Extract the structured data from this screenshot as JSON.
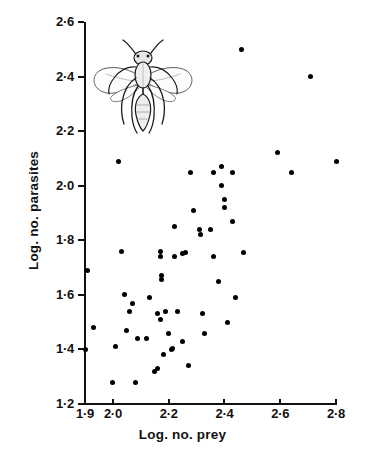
{
  "chart_data": {
    "type": "scatter",
    "title": "",
    "xlabel": "Log. no. prey",
    "ylabel": "Log. no. parasites",
    "xlim": [
      1.9,
      2.8
    ],
    "ylim": [
      1.2,
      2.6
    ],
    "grid": false,
    "legend": null,
    "xticks": [
      1.9,
      2.0,
      2.2,
      2.4,
      2.6,
      2.8
    ],
    "xtick_labels": [
      "1·9",
      "2·0",
      "2·2",
      "2·4",
      "2·6",
      "2·8"
    ],
    "yticks": [
      1.2,
      1.4,
      1.6,
      1.8,
      2.0,
      2.2,
      2.4,
      2.6
    ],
    "ytick_labels": [
      "1·2",
      "1·4",
      "1·6",
      "1·8",
      "2·0",
      "2·2",
      "2·4",
      "2·6"
    ],
    "marker": "filled-circle",
    "marker_color": "#000000",
    "points": [
      {
        "x": 1.9,
        "y": 1.4
      },
      {
        "x": 1.91,
        "y": 1.69
      },
      {
        "x": 1.93,
        "y": 1.48
      },
      {
        "x": 2.0,
        "y": 1.28
      },
      {
        "x": 2.01,
        "y": 1.41
      },
      {
        "x": 2.02,
        "y": 2.09
      },
      {
        "x": 2.03,
        "y": 1.76
      },
      {
        "x": 2.04,
        "y": 1.6
      },
      {
        "x": 2.05,
        "y": 1.47
      },
      {
        "x": 2.06,
        "y": 1.54
      },
      {
        "x": 2.07,
        "y": 1.57
      },
      {
        "x": 2.08,
        "y": 1.28
      },
      {
        "x": 2.09,
        "y": 1.44
      },
      {
        "x": 2.12,
        "y": 1.44
      },
      {
        "x": 2.13,
        "y": 1.59
      },
      {
        "x": 2.15,
        "y": 1.32
      },
      {
        "x": 2.16,
        "y": 1.33
      },
      {
        "x": 2.16,
        "y": 1.53
      },
      {
        "x": 2.17,
        "y": 1.51
      },
      {
        "x": 2.17,
        "y": 1.76
      },
      {
        "x": 2.17,
        "y": 1.74
      },
      {
        "x": 2.175,
        "y": 1.67
      },
      {
        "x": 2.175,
        "y": 1.655
      },
      {
        "x": 2.18,
        "y": 1.38
      },
      {
        "x": 2.19,
        "y": 1.54
      },
      {
        "x": 2.2,
        "y": 1.46
      },
      {
        "x": 2.21,
        "y": 1.4
      },
      {
        "x": 2.215,
        "y": 1.405
      },
      {
        "x": 2.22,
        "y": 1.85
      },
      {
        "x": 2.22,
        "y": 1.74
      },
      {
        "x": 2.23,
        "y": 1.54
      },
      {
        "x": 2.25,
        "y": 1.75
      },
      {
        "x": 2.25,
        "y": 1.43
      },
      {
        "x": 2.26,
        "y": 1.755
      },
      {
        "x": 2.27,
        "y": 1.34
      },
      {
        "x": 2.28,
        "y": 2.05
      },
      {
        "x": 2.29,
        "y": 1.91
      },
      {
        "x": 2.31,
        "y": 1.84
      },
      {
        "x": 2.315,
        "y": 1.82
      },
      {
        "x": 2.32,
        "y": 1.53
      },
      {
        "x": 2.33,
        "y": 1.46
      },
      {
        "x": 2.35,
        "y": 1.84
      },
      {
        "x": 2.36,
        "y": 1.74
      },
      {
        "x": 2.36,
        "y": 2.05
      },
      {
        "x": 2.38,
        "y": 1.65
      },
      {
        "x": 2.39,
        "y": 2.07
      },
      {
        "x": 2.39,
        "y": 2.0
      },
      {
        "x": 2.4,
        "y": 1.95
      },
      {
        "x": 2.4,
        "y": 1.92
      },
      {
        "x": 2.41,
        "y": 1.5
      },
      {
        "x": 2.43,
        "y": 1.87
      },
      {
        "x": 2.43,
        "y": 2.05
      },
      {
        "x": 2.44,
        "y": 1.59
      },
      {
        "x": 2.46,
        "y": 2.5
      },
      {
        "x": 2.47,
        "y": 1.755
      },
      {
        "x": 2.59,
        "y": 2.12
      },
      {
        "x": 2.64,
        "y": 2.05
      },
      {
        "x": 2.71,
        "y": 2.4
      },
      {
        "x": 2.8,
        "y": 2.09
      }
    ],
    "illustration": "parasitic-wasp-line-drawing",
    "n_points": 59
  },
  "axes": {
    "x_title": "Log. no. prey",
    "y_title": "Log. no. parasites"
  }
}
